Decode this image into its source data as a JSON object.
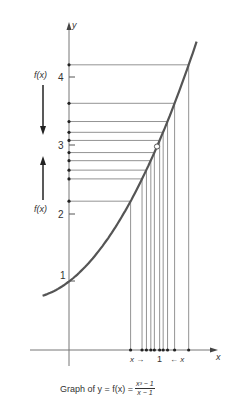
{
  "chart_data": {
    "type": "line",
    "function": "f(x) = (x^3 - 1)/(x - 1)",
    "xlabel": "x",
    "ylabel": "y",
    "y_ticks": [
      1,
      2,
      3,
      4
    ],
    "x_ticks": [
      1
    ],
    "hole": {
      "x": 1,
      "y": 3
    },
    "curve_x_range": [
      -0.3,
      1.45
    ],
    "approach_x_values_left": [
      0.7,
      0.83,
      0.88,
      0.93,
      0.97
    ],
    "approach_x_values_right": [
      1.03,
      1.07,
      1.12,
      1.2,
      1.36
    ],
    "approach_points": [
      {
        "x": 0.7,
        "y": 2.19
      },
      {
        "x": 0.83,
        "y": 2.52
      },
      {
        "x": 0.88,
        "y": 2.65
      },
      {
        "x": 0.93,
        "y": 2.79
      },
      {
        "x": 0.97,
        "y": 2.91
      },
      {
        "x": 1.03,
        "y": 3.09
      },
      {
        "x": 1.07,
        "y": 3.21
      },
      {
        "x": 1.12,
        "y": 3.37
      },
      {
        "x": 1.2,
        "y": 3.64
      },
      {
        "x": 1.36,
        "y": 4.21
      }
    ],
    "annotations": [
      "f(x) ↓ (from above toward 3)",
      "f(x) ↑ (from below toward 3)",
      "x →",
      "← x"
    ]
  },
  "labels": {
    "y_axis": "y",
    "x_axis": "x",
    "tick_1": "1",
    "tick_2": "2",
    "tick_3": "3",
    "tick_4": "4",
    "x_tick_1": "1",
    "fx_top": "f(x)",
    "fx_bottom": "f(x)",
    "x_left_arrow": "x →",
    "x_right_arrow": "← x"
  },
  "caption": {
    "prefix": "Graph of y = f(x) =",
    "numerator": "x³ − 1",
    "denominator": "x − 1"
  },
  "colors": {
    "curve": "#555555",
    "lines": "#666666",
    "text": "#333333"
  }
}
